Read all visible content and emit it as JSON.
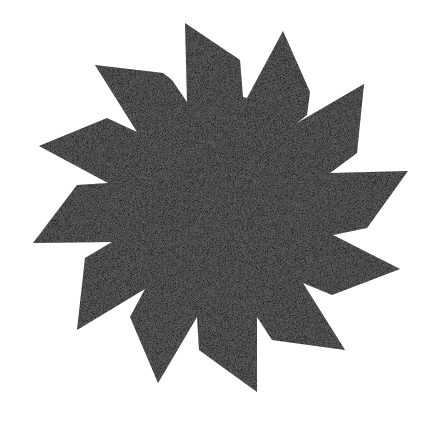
{
  "image": {
    "description": "Twelve-pointed black pinwheel/sun star shape with grainy halftone texture on white background",
    "shape": "twelve-point-pinwheel-star",
    "points_count": 12,
    "fill_color": "#262626",
    "background_color": "#ffffff",
    "polygon_points": "185,23 240,60 243,97 247,98 283,31 310,92 307,115 297,123 364,84 357,153 330,173 408,171 367,228 333,235 400,269 332,295 303,283 345,350 272,340 257,317 257,392 199,350 197,317 158,383 130,317 145,289 77,330 85,258 112,242 33,243 77,185 108,183 39,146 107,118 137,132 95,65 163,73 172,80 187,102"
  }
}
